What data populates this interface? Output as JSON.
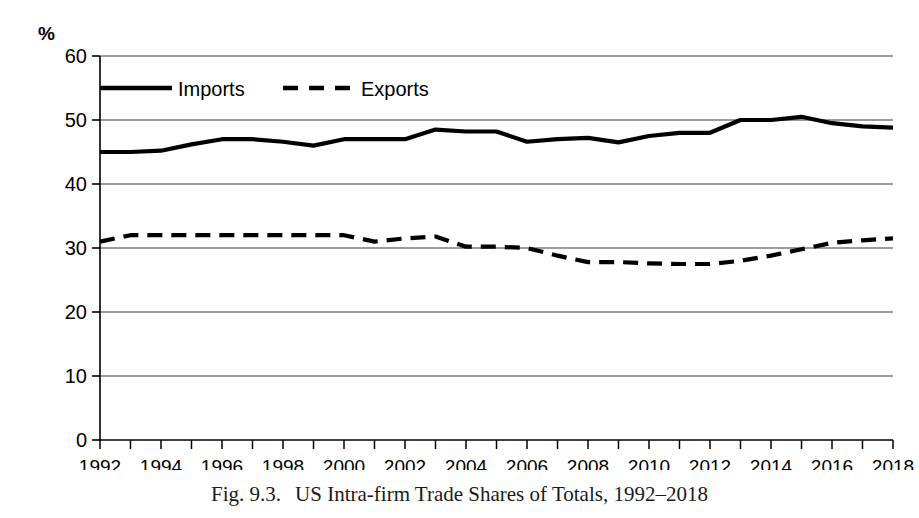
{
  "figure": {
    "caption_number": "Fig. 9.3.",
    "caption_text": "US Intra-firm Trade Shares of Totals, 1992–2018",
    "unit_label": "%"
  },
  "chart_data": {
    "type": "line",
    "title": "US Intra-firm Trade Shares of Totals, 1992–2018",
    "xlabel": "",
    "ylabel": "%",
    "ylim": [
      0,
      60
    ],
    "yticks": [
      0,
      10,
      20,
      30,
      40,
      50,
      60
    ],
    "ytick_labels": [
      "0",
      "10",
      "20",
      "30",
      "40",
      "50",
      "60"
    ],
    "xlim": [
      1992,
      2018
    ],
    "xticks": [
      1992,
      1994,
      1996,
      1998,
      2000,
      2002,
      2004,
      2006,
      2008,
      2010,
      2012,
      2014,
      2016,
      2018
    ],
    "xtick_labels": [
      "1992",
      "1994",
      "1996",
      "1998",
      "2000",
      "2002",
      "2004",
      "2006",
      "2008",
      "2010",
      "2012",
      "2014",
      "2016",
      "2018"
    ],
    "x": [
      1992,
      1993,
      1994,
      1995,
      1996,
      1997,
      1998,
      1999,
      2000,
      2001,
      2002,
      2003,
      2004,
      2005,
      2006,
      2007,
      2008,
      2009,
      2010,
      2011,
      2012,
      2013,
      2014,
      2015,
      2016,
      2017,
      2018
    ],
    "grid": "horizontal",
    "legend_position": "upper-left-inside",
    "series": [
      {
        "name": "Imports",
        "style": "solid",
        "color": "#000000",
        "values": [
          45.0,
          45.0,
          45.2,
          46.2,
          47.0,
          47.0,
          46.6,
          46.0,
          47.0,
          47.0,
          47.0,
          48.5,
          48.2,
          48.2,
          46.6,
          47.0,
          47.2,
          46.5,
          47.5,
          48.0,
          48.0,
          50.0,
          50.0,
          50.5,
          49.5,
          49.0,
          48.8
        ]
      },
      {
        "name": "Exports",
        "style": "dashed",
        "color": "#000000",
        "values": [
          31.0,
          32.0,
          32.0,
          32.0,
          32.0,
          32.0,
          32.0,
          32.0,
          32.0,
          31.0,
          31.5,
          31.8,
          30.2,
          30.2,
          30.0,
          28.8,
          27.8,
          27.8,
          27.6,
          27.5,
          27.5,
          28.0,
          28.8,
          29.8,
          30.8,
          31.2,
          31.5
        ]
      }
    ]
  },
  "legend": {
    "items": [
      {
        "label": "Imports",
        "style": "solid"
      },
      {
        "label": "Exports",
        "style": "dashed"
      }
    ]
  }
}
